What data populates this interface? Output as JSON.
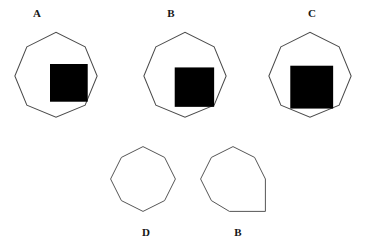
{
  "figure": {
    "background_color": "#ffffff",
    "outline_color": "#4a4a4a",
    "occluder_color": "#000000",
    "label_color": "#161616",
    "stroke_width": 1,
    "width": 365,
    "height": 247
  },
  "panels": [
    {
      "id": "a",
      "label": "A",
      "label_position": "top",
      "shape_name": "octagon",
      "occluder_name": "black-square",
      "octagon_points": "22,22 56,5 90,22 104,56 90,90 56,104 22,90 8,56",
      "occluder": {
        "x": 49,
        "y": 42,
        "width": 44,
        "height": 44
      },
      "description": "Regular octagon partially occluded by a black square overlapping its lower-right region"
    },
    {
      "id": "b",
      "label": "B",
      "label_position": "top",
      "shape_name": "octagon",
      "occluder_name": "black-square",
      "octagon_points": "22,22 56,5 90,22 104,56 90,90 56,104 22,90 8,56",
      "occluder": {
        "x": 44,
        "y": 46,
        "width": 46,
        "height": 46
      },
      "description": "Regular octagon partially occluded by a black square overlapping its lower-right region, square shifted left and down"
    },
    {
      "id": "c",
      "label": "C",
      "label_position": "top",
      "shape_name": "octagon",
      "occluder_name": "black-square",
      "octagon_points": "22,22 56,5 90,22 104,56 90,90 56,104 22,90 8,56",
      "occluder": {
        "x": 33,
        "y": 44,
        "width": 50,
        "height": 50
      },
      "description": "Regular octagon partially occluded by a larger black square overlapping deeply into its lower-right region"
    },
    {
      "id": "d",
      "label": "D",
      "label_position": "bottom",
      "shape_name": "octagon",
      "occluder_name": null,
      "octagon_points": "20,20 50,5 80,20 95,50 80,80 50,95 20,80 5,50",
      "occluder": null,
      "description": "Complete regular octagon, unoccluded"
    },
    {
      "id": "e",
      "label": "B",
      "label_position": "bottom",
      "shape_name": "octagon-with-square-corner",
      "occluder_name": null,
      "octagon_points": "20,20 50,5 80,20 95,50 95,95 45,95 20,80 5,50",
      "occluder": null,
      "description": "Octagon variant with a square right-angle corner at the bottom right, unoccluded"
    }
  ]
}
